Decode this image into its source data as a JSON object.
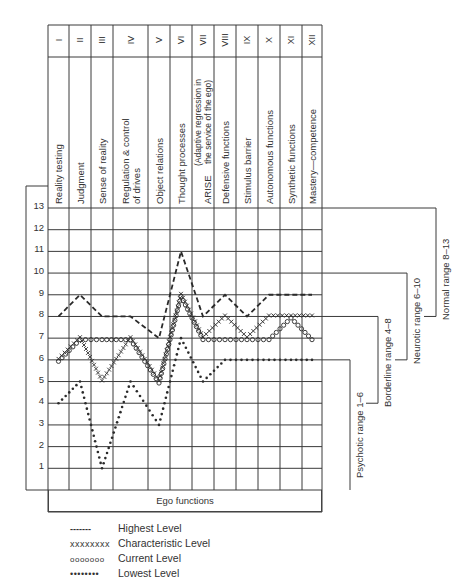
{
  "chart_data": {
    "type": "line",
    "title": "",
    "xlabel": "Ego functions",
    "ylabel": "",
    "ylim": [
      0,
      13
    ],
    "y_ticks": [
      1,
      2,
      3,
      4,
      5,
      6,
      7,
      8,
      9,
      10,
      11,
      12,
      13
    ],
    "grid": true,
    "categories": [
      "I",
      "II",
      "III",
      "IV",
      "V",
      "VI",
      "VII",
      "VIII",
      "IX",
      "X",
      "XI",
      "XII"
    ],
    "category_labels": [
      "Reality testing",
      "Judgment",
      "Sense of reality",
      "Regulation & control of drives",
      "Object relations",
      "Thought processes",
      "ARISE (Adaptive regression in the service of the ego)",
      "Defensive functions",
      "Stimulus barrier",
      "Autonomous functions",
      "Synthetic functions",
      "Mastery—competence"
    ],
    "series": [
      {
        "name": "Highest Level",
        "style": "dashed",
        "values": [
          8,
          9,
          8,
          8,
          7,
          11,
          8,
          9,
          8,
          9,
          9,
          9
        ]
      },
      {
        "name": "Characteristic Level",
        "style": "x-marks",
        "values": [
          6,
          7,
          5,
          7,
          5,
          9,
          7,
          8,
          7,
          8,
          8,
          8
        ]
      },
      {
        "name": "Current Level",
        "style": "circles",
        "values": [
          6,
          7,
          7,
          7,
          5,
          9,
          7,
          7,
          7,
          7,
          8,
          7
        ]
      },
      {
        "name": "Lowest Level",
        "style": "dotted",
        "values": [
          4,
          5,
          1,
          5,
          3,
          7,
          5,
          6,
          6,
          6,
          6,
          6
        ]
      }
    ],
    "ranges": [
      {
        "label": "Psychotic range 1–6",
        "from": 1,
        "to": 6
      },
      {
        "label": "Borderline range 4–8",
        "from": 4,
        "to": 8
      },
      {
        "label": "Neurotic range 6–10",
        "from": 6,
        "to": 10
      },
      {
        "label": "Normal range 8–13",
        "from": 8,
        "to": 13
      }
    ],
    "legend_position": "bottom-left"
  },
  "header": {
    "numerals": [
      "I",
      "II",
      "III",
      "IV",
      "V",
      "VI",
      "VII",
      "VIII",
      "IX",
      "X",
      "XI",
      "XII"
    ],
    "labels": [
      [
        "Reality testing"
      ],
      [
        "Judgment"
      ],
      [
        "Sense of reality"
      ],
      [
        "Regulation & control",
        "of drives"
      ],
      [
        "Object relations"
      ],
      [
        "Thought processes"
      ],
      [
        "ARISE",
        "(Adaptive regression in",
        "the service of the ego)"
      ],
      [
        "Defensive functions"
      ],
      [
        "Stimulus barrier"
      ],
      [
        "Autonomous functions"
      ],
      [
        "Synthetic functions"
      ],
      [
        "Mastery—competence"
      ]
    ]
  },
  "axis": {
    "x_title": "Ego functions"
  },
  "legend": {
    "items": [
      {
        "symbol": "-------",
        "label": "Highest Level"
      },
      {
        "symbol": "xxxxxxxx",
        "label": "Characteristic Level"
      },
      {
        "symbol": "ooooooo",
        "label": "Current Level"
      },
      {
        "symbol": "••••••••",
        "label": "Lowest Level"
      }
    ]
  },
  "colors": {
    "ink": "#2a2a2a",
    "grid": "#3a3a3a",
    "background": "#ffffff"
  }
}
